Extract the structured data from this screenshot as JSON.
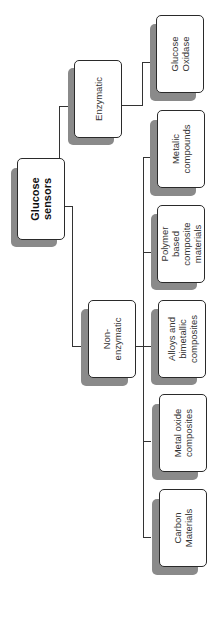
{
  "diagram": {
    "type": "tree",
    "orientation": "rotated-90-ccw",
    "root": {
      "id": "root",
      "label": "Glucose\nsensors"
    },
    "nodes": [
      {
        "id": "root",
        "label": "Glucose\nsensors",
        "parent": null
      },
      {
        "id": "enzymatic",
        "label": "Enzymatic",
        "parent": "root"
      },
      {
        "id": "non_enzymatic",
        "label": "Non-\nenzymatic",
        "parent": "root"
      },
      {
        "id": "glucose_oxidase",
        "label": "Glucose\nOxidase",
        "parent": "enzymatic"
      },
      {
        "id": "metalic_compounds",
        "label": "Metalic\ncompounds",
        "parent": "non_enzymatic"
      },
      {
        "id": "polymer",
        "label": "Polymer\nbased\ncomposite\nmaterials",
        "parent": "non_enzymatic"
      },
      {
        "id": "alloys",
        "label": "Alloys and\nbimetallic\ncomposites",
        "parent": "non_enzymatic"
      },
      {
        "id": "metal_oxide",
        "label": "Metal oxide\ncomposites",
        "parent": "non_enzymatic"
      },
      {
        "id": "carbon",
        "label": "Carbon\nMaterials",
        "parent": "non_enzymatic"
      }
    ]
  },
  "labels": {
    "root": "Glucose\nsensors",
    "enzymatic": "Enzymatic",
    "non_enzymatic": "Non-\nenzymatic",
    "glucose_oxidase": "Glucose\nOxidase",
    "metalic_compounds": "Metalic\ncompounds",
    "polymer": "Polymer\nbased\ncomposite\nmaterials",
    "alloys": "Alloys and\nbimetallic\ncomposites",
    "metal_oxide": "Metal oxide\ncomposites",
    "carbon": "Carbon\nMaterials"
  },
  "colors": {
    "shadow": "#8a8a8a",
    "border": "#2a2a2a",
    "line": "#333333"
  }
}
